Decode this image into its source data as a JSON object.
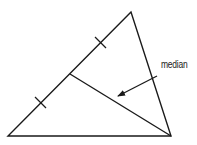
{
  "diagram": {
    "type": "geometry",
    "colors": {
      "stroke": "#1a1a1a",
      "background": "#ffffff",
      "text": "#222222"
    },
    "vertices": {
      "apex": [
        131,
        12
      ],
      "bottom_left": [
        8,
        136
      ],
      "bottom_right": [
        171,
        136
      ]
    },
    "midpoint": [
      70,
      74
    ],
    "tick_marks": [
      {
        "center": [
          100,
          42
        ]
      },
      {
        "center": [
          40,
          102
        ]
      }
    ],
    "arrow": {
      "from": [
        157,
        76
      ],
      "to": [
        117,
        96
      ]
    },
    "label": {
      "text": "median",
      "position": [
        161,
        60
      ]
    }
  }
}
